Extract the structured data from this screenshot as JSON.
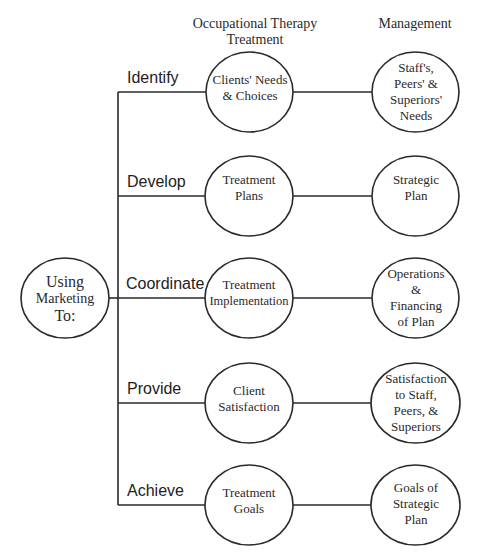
{
  "headers": {
    "treatment": "Occupational Therapy Treatment",
    "management": "Management"
  },
  "root": {
    "label": "Using Marketing To:",
    "lines": [
      "Using",
      "Marketing",
      "To:"
    ]
  },
  "rows": [
    {
      "verb": "Identify",
      "treatment_lines": [
        "Clients' Needs",
        "& Choices"
      ],
      "management_lines": [
        "Staff's,",
        "Peers' &",
        "Superiors'",
        "Needs"
      ]
    },
    {
      "verb": "Develop",
      "treatment_lines": [
        "Treatment",
        "Plans"
      ],
      "management_lines": [
        "Strategic",
        "Plan"
      ]
    },
    {
      "verb": "Coordinate",
      "treatment_lines": [
        "Treatment",
        "Implementation"
      ],
      "management_lines": [
        "Operations",
        "&",
        "Financing",
        "of Plan"
      ]
    },
    {
      "verb": "Provide",
      "treatment_lines": [
        "Client",
        "Satisfaction"
      ],
      "management_lines": [
        "Satisfaction",
        "to Staff,",
        "Peers, &",
        "Superiors"
      ]
    },
    {
      "verb": "Achieve",
      "treatment_lines": [
        "Treatment",
        "Goals"
      ],
      "management_lines": [
        "Goals of",
        "Strategic",
        "Plan"
      ]
    }
  ],
  "colors": {
    "stroke": "#2a2a2a",
    "text": "#2a2a2a",
    "background": "#ffffff"
  }
}
